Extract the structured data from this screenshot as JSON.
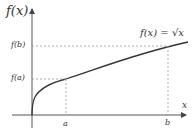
{
  "labels": {
    "y_axis": "f(x)",
    "x_axis": "x",
    "fb": "f(b)",
    "fa": "f(a)",
    "a": "a",
    "b": "b",
    "func": "f(x) = √x"
  },
  "colors": {
    "axis": "#555555",
    "curve": "#333333",
    "dashed": "#999999"
  },
  "geometry": {
    "origin": [
      32,
      115
    ],
    "a_x": 66,
    "b_x": 168,
    "fa_y": 79,
    "fb_y": 46
  }
}
